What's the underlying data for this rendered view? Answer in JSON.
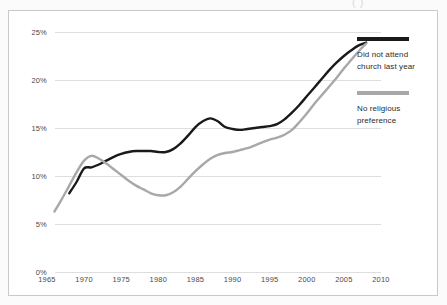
{
  "clipped_header": "(           )",
  "legend": {
    "entries": [
      {
        "label": "Did not attend\nchurch last  year",
        "color": "#1a1a1a"
      },
      {
        "label": "No religious\npreference",
        "color": "#a8a8a8"
      }
    ]
  },
  "chart_data": {
    "type": "line",
    "title": "",
    "xlabel": "",
    "ylabel": "",
    "xlim": [
      1965,
      2010
    ],
    "ylim": [
      0,
      25
    ],
    "grid": true,
    "legend_position": "right",
    "xticks": [
      1965,
      1970,
      1975,
      1980,
      1985,
      1990,
      1995,
      2000,
      2005,
      2010
    ],
    "xticklabels": [
      "1965",
      "1970",
      "1975",
      "1980",
      "1985",
      "1990",
      "1995",
      "2000",
      "2005",
      "2010"
    ],
    "yticks": [
      0,
      5,
      10,
      15,
      20,
      25
    ],
    "yticklabels": [
      "0%",
      "5%",
      "10%",
      "15%",
      "20%",
      "25%"
    ],
    "series": [
      {
        "name": "Did not attend church last  year",
        "color": "#1a1a1a",
        "x": [
          1968,
          1969,
          1970,
          1971,
          1972,
          1973,
          1974,
          1975,
          1976,
          1977,
          1978,
          1979,
          1980,
          1981,
          1982,
          1983,
          1984,
          1985,
          1986,
          1987,
          1988,
          1989,
          1990,
          1991,
          1992,
          1993,
          1994,
          1995,
          1996,
          1997,
          1998,
          1999,
          2000,
          2001,
          2002,
          2003,
          2004,
          2005,
          2006,
          2007,
          2008
        ],
        "values": [
          8.2,
          9.4,
          10.8,
          10.9,
          11.2,
          11.6,
          12.0,
          12.3,
          12.5,
          12.6,
          12.6,
          12.6,
          12.5,
          12.5,
          12.8,
          13.4,
          14.2,
          15.1,
          15.7,
          16.0,
          15.7,
          15.1,
          14.9,
          14.8,
          14.9,
          15.0,
          15.1,
          15.2,
          15.4,
          15.9,
          16.6,
          17.4,
          18.3,
          19.2,
          20.1,
          21.0,
          21.8,
          22.5,
          23.1,
          23.6,
          23.9
        ]
      },
      {
        "name": "No religious preference",
        "color": "#a8a8a8",
        "x": [
          1966,
          1967,
          1968,
          1969,
          1970,
          1971,
          1972,
          1973,
          1974,
          1975,
          1976,
          1977,
          1978,
          1979,
          1980,
          1981,
          1982,
          1983,
          1984,
          1985,
          1986,
          1987,
          1988,
          1989,
          1990,
          1991,
          1992,
          1993,
          1994,
          1995,
          1996,
          1997,
          1998,
          1999,
          2000,
          2001,
          2002,
          2003,
          2004,
          2005,
          2006,
          2007,
          2008
        ],
        "values": [
          6.3,
          7.6,
          9.0,
          10.4,
          11.6,
          12.1,
          11.8,
          11.3,
          10.7,
          10.1,
          9.5,
          9.0,
          8.6,
          8.2,
          8.0,
          8.0,
          8.3,
          8.9,
          9.7,
          10.5,
          11.2,
          11.8,
          12.2,
          12.4,
          12.5,
          12.7,
          12.9,
          13.2,
          13.5,
          13.8,
          14.0,
          14.3,
          14.8,
          15.6,
          16.5,
          17.5,
          18.4,
          19.3,
          20.2,
          21.2,
          22.1,
          23.0,
          23.8
        ]
      }
    ]
  }
}
